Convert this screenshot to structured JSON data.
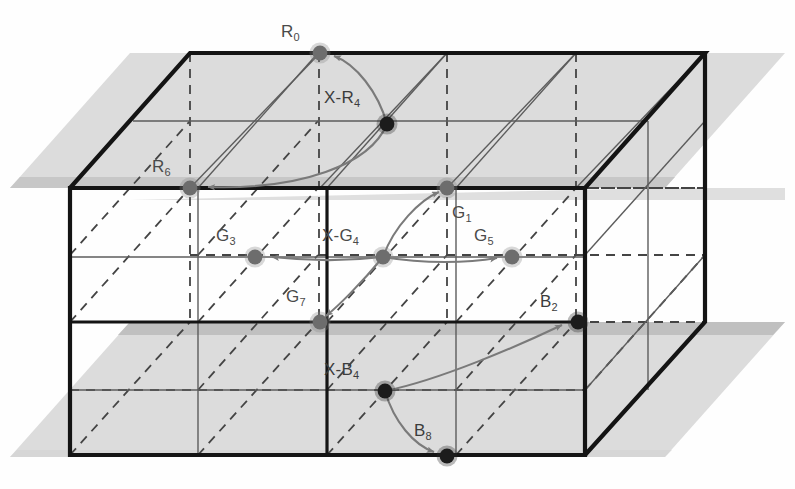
{
  "figure": {
    "type": "3d-lattice-diagram",
    "title": "",
    "background_color": "#ffffff",
    "plane_color": "#d9d9d9",
    "plane_band_color": "#bdbdbd",
    "edge_color": "#1a1a1a",
    "grid_color": "#6e6e6e",
    "node_light_color": "#6d6d6d",
    "node_dark_color": "#1c1c1c",
    "arrow_color": "#7a7a7a",
    "label_color": "#4a4a4a"
  },
  "nodes": [
    {
      "id": "R0",
      "base": "R",
      "sub": "0",
      "x": 320,
      "y": 53,
      "tone": "light",
      "label_x": 281,
      "label_y": 22
    },
    {
      "id": "XR4",
      "base": "X-R",
      "sub": "4",
      "x": 387,
      "y": 124,
      "tone": "dark",
      "label_x": 324,
      "label_y": 88
    },
    {
      "id": "R6",
      "base": "R",
      "sub": "6",
      "x": 190,
      "y": 188,
      "tone": "light",
      "label_x": 152,
      "label_y": 157
    },
    {
      "id": "G1",
      "base": "G",
      "sub": "1",
      "x": 447,
      "y": 188,
      "tone": "light",
      "label_x": 452,
      "label_y": 203
    },
    {
      "id": "G3",
      "base": "G",
      "sub": "3",
      "x": 255,
      "y": 257,
      "tone": "light",
      "label_x": 216,
      "label_y": 226
    },
    {
      "id": "XG4",
      "base": "X-G",
      "sub": "4",
      "x": 383,
      "y": 257,
      "tone": "light",
      "label_x": 322,
      "label_y": 226
    },
    {
      "id": "G5",
      "base": "G",
      "sub": "5",
      "x": 512,
      "y": 257,
      "tone": "light",
      "label_x": 474,
      "label_y": 226
    },
    {
      "id": "G7",
      "base": "G",
      "sub": "7",
      "x": 320,
      "y": 322,
      "tone": "light",
      "label_x": 286,
      "label_y": 287
    },
    {
      "id": "B2",
      "base": "B",
      "sub": "2",
      "x": 578,
      "y": 322,
      "tone": "dark",
      "label_x": 540,
      "label_y": 292
    },
    {
      "id": "XB4",
      "base": "X-B",
      "sub": "4",
      "x": 385,
      "y": 391,
      "tone": "dark",
      "label_x": 324,
      "label_y": 360
    },
    {
      "id": "B8",
      "base": "B",
      "sub": "8",
      "x": 447,
      "y": 456,
      "tone": "dark",
      "label_x": 414,
      "label_y": 421
    }
  ],
  "arrows": [
    {
      "name": "xr4-to-r0",
      "from": "XR4",
      "to": "R0"
    },
    {
      "name": "xr4-to-r6",
      "from": "XR4",
      "to": "R6"
    },
    {
      "name": "xg4-to-g1",
      "from": "XG4",
      "to": "G1"
    },
    {
      "name": "xg4-to-g3",
      "from": "XG4",
      "to": "G3"
    },
    {
      "name": "xg4-to-g5",
      "from": "XG4",
      "to": "G5"
    },
    {
      "name": "xg4-to-g7",
      "from": "XG4",
      "to": "G7"
    },
    {
      "name": "xb4-to-b2",
      "from": "XB4",
      "to": "B2"
    },
    {
      "name": "xb4-to-b8",
      "from": "XB4",
      "to": "B8"
    }
  ],
  "cube": {
    "front_top_left": [
      70,
      188
    ],
    "front_top_right": [
      585,
      188
    ],
    "front_bot_left": [
      70,
      455
    ],
    "front_bot_right": [
      585,
      455
    ],
    "back_top_left": [
      190,
      53
    ],
    "back_top_right": [
      705,
      53
    ],
    "back_bot_left": [
      190,
      322
    ],
    "back_bot_right": [
      705,
      322
    ],
    "divisions": 4
  },
  "planes": [
    {
      "name": "upper-plane",
      "y_front": 188,
      "y_back": 53
    },
    {
      "name": "lower-plane",
      "y_front": 322,
      "y_back": 188
    }
  ]
}
